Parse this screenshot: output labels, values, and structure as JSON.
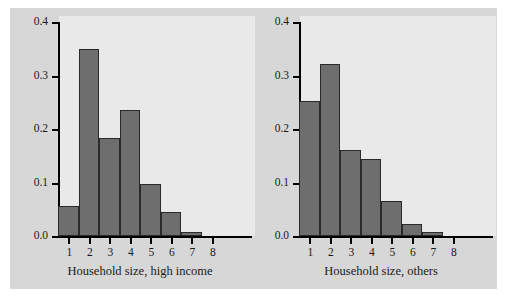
{
  "figure": {
    "background_color": "#d7d7d7",
    "plot_background_color": "#e9e9e9",
    "bar_color": "#6e6e6e",
    "bar_edge_color": "#2a2a2a",
    "axis_color": "#000000"
  },
  "chart_data": [
    {
      "type": "bar",
      "title": "",
      "xlabel": "Household size, high income",
      "ylabel": "",
      "categories": [
        "1",
        "2",
        "3",
        "4",
        "5",
        "6",
        "7",
        "8"
      ],
      "values": [
        0.056,
        0.35,
        0.183,
        0.235,
        0.098,
        0.045,
        0.008,
        0.0
      ],
      "xlim": [
        0.5,
        8.5
      ],
      "ylim": [
        0.0,
        0.4
      ],
      "yticks": [
        "0.0",
        "0.1",
        "0.2",
        "0.3",
        "0.4"
      ],
      "ytick_values": [
        0.0,
        0.1,
        0.2,
        0.3,
        0.4
      ],
      "xticks": [
        "1",
        "2",
        "3",
        "4",
        "5",
        "6",
        "7",
        "8"
      ],
      "grid": false,
      "legend": false
    },
    {
      "type": "bar",
      "title": "",
      "xlabel": "Household size, others",
      "ylabel": "",
      "categories": [
        "1",
        "2",
        "3",
        "4",
        "5",
        "6",
        "7",
        "8"
      ],
      "values": [
        0.253,
        0.321,
        0.16,
        0.144,
        0.066,
        0.022,
        0.008,
        0.0
      ],
      "xlim": [
        0.5,
        8.5
      ],
      "ylim": [
        0.0,
        0.4
      ],
      "yticks": [
        "0.0",
        "0.1",
        "0.2",
        "0.3",
        "0.4"
      ],
      "ytick_values": [
        0.0,
        0.1,
        0.2,
        0.3,
        0.4
      ],
      "xticks": [
        "1",
        "2",
        "3",
        "4",
        "5",
        "6",
        "7",
        "8"
      ],
      "grid": false,
      "legend": false
    }
  ]
}
